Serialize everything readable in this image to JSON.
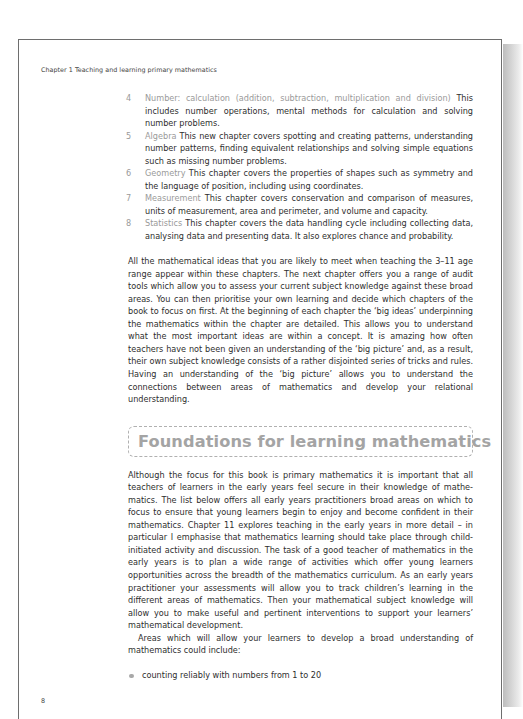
{
  "page": {
    "running_head": "Chapter 1  Teaching and learning primary mathematics",
    "page_number": "8"
  },
  "chapter_list": [
    {
      "number": "4",
      "topic": "Number: calculation (addition, subtraction, multiplication and division)",
      "description": "This includes number operations, mental methods for calculation and solving number problems."
    },
    {
      "number": "5",
      "topic": "Algebra",
      "description": "This new chapter covers spotting and creating patterns, under­standing number patterns, finding equivalent relationships and solving simple equations such as missing number problems."
    },
    {
      "number": "6",
      "topic": "Geometry",
      "description": "This chapter covers the properties of shapes such as symmetry and the language of position, including using coordinates."
    },
    {
      "number": "7",
      "topic": "Measurement",
      "description": "This chapter covers conservation and comparison of measures, units of measurement, area and perimeter, and volume and capacity."
    },
    {
      "number": "8",
      "topic": "Statistics",
      "description": "This chapter covers the data handling cycle including collecting data, analysing data and presenting data. It also explores chance and probability."
    }
  ],
  "paragraphs": {
    "intro": "All the mathematical ideas that you are likely to meet when teaching the 3–11 age range appear within these chapters. The next chapter offers you a range of audit tools which allow you to assess your current subject knowledge against these broad areas. You can then prioritise your own learning and decide which chapters of the book to focus on first. At the beginning of each chapter the ‘big ideas’ underpinning the mathematics within the chapter are detailed. This allows you to understand what the most important ideas are within a concept. It is amazing how often teachers have not been given an understanding of the ‘big picture’ and, as a result, their own subject knowledge consists of a rather disjointed series of tricks and rules. Having an understanding of the ‘big picture’ allows you to understand the connections between areas of mathematics and develop your relational understanding."
  },
  "section": {
    "heading": "Foundations for learning mathematics",
    "paragraph_1": "Although the focus for this book is primary mathematics it is important that all teachers of learners in the early years feel secure in their knowledge of mathe­matics. The list below offers all early years practitioners broad areas on which to focus to ensure that young learners begin to enjoy and become confident in their mathematics. Chapter 11 explores teaching in the early years in more detail – in particular I emphasise that mathematics learning should take place through child-initiated activity and discussion. The task of a good teacher of mathematics in the early years is to plan a wide range of activities which offer young learners opportunities across the breadth of the mathematics curriculum. As an early years practitioner your assessments will allow you to track children’s learning in the different areas of mathematics. Then your mathematical subject knowledge will allow you to make useful and pertinent interventions to support your learners’ mathematical development.",
    "paragraph_2": "Areas which will allow your learners to develop a broad understanding of mathematics could include:",
    "bullets": [
      "counting reliably with numbers from 1 to 20"
    ]
  },
  "colors": {
    "text": "#2e2e2e",
    "topic_grey": "#9a9a9a",
    "heading_grey": "#a4a4a4",
    "border": "#6e6e6e"
  }
}
